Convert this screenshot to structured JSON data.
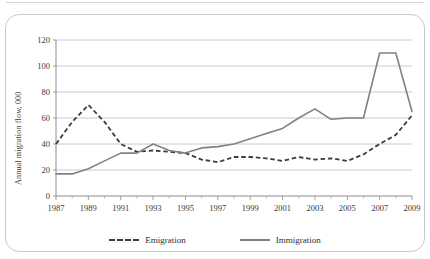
{
  "figure": {
    "frame_color": "#c9c9c9",
    "background": "#ffffff"
  },
  "axis_titles": {
    "y": "Annual migration flow, 000",
    "x": ""
  },
  "legend": {
    "emigration_label": "Emigration",
    "immigration_label": "Immigration",
    "emigration_style": "dashed",
    "immigration_style": "solid"
  },
  "chart_data": {
    "type": "line",
    "title": "",
    "xlabel": "",
    "ylabel": "Annual migration flow, 000",
    "xlim": [
      1987,
      2009
    ],
    "ylim": [
      0,
      120
    ],
    "yticks": [
      0,
      20,
      40,
      60,
      80,
      100,
      120
    ],
    "xticks": [
      1987,
      1989,
      1991,
      1993,
      1995,
      1997,
      1999,
      2001,
      2003,
      2005,
      2007,
      2009
    ],
    "x": [
      1987,
      1988,
      1989,
      1990,
      1991,
      1992,
      1993,
      1994,
      1995,
      1996,
      1997,
      1998,
      1999,
      2000,
      2001,
      2002,
      2003,
      2004,
      2005,
      2006,
      2007,
      2008,
      2009
    ],
    "grid": "horizontal",
    "legend_position": "bottom",
    "minor_xticks_every": 1,
    "series": [
      {
        "name": "Emigration",
        "style": "dashed",
        "color": "#3d3d3d",
        "values": [
          40,
          57,
          70,
          57,
          40,
          34,
          35,
          34,
          33,
          28,
          26,
          30,
          30,
          29,
          27,
          30,
          28,
          29,
          27,
          32,
          40,
          47,
          62
        ]
      },
      {
        "name": "Immigration",
        "style": "solid",
        "color": "#818181",
        "values": [
          17,
          17,
          21,
          27,
          33,
          33,
          40,
          35,
          33,
          37,
          38,
          40,
          44,
          48,
          52,
          60,
          67,
          59,
          60,
          60,
          110,
          110,
          65
        ]
      }
    ],
    "annotations": []
  }
}
